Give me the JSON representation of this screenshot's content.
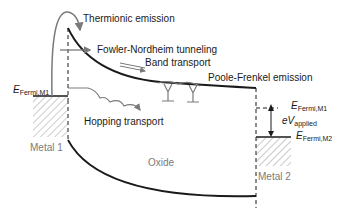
{
  "diagram": {
    "labels": {
      "thermionic": "Thermionic emission",
      "fowler": "Fowler-Nordheim tunneling",
      "band": "Band transport",
      "poole": "Poole-Frenkel emission",
      "hopping": "Hopping transport",
      "oxide": "Oxide",
      "metal1": "Metal 1",
      "metal2": "Metal 2"
    },
    "fermi_m1_left": {
      "main": "E",
      "sub": "Fermi,M1"
    },
    "fermi_m1_right": {
      "main": "E",
      "sub": "Fermi,M1"
    },
    "fermi_m2": {
      "main": "E",
      "sub": "Fermi,M2"
    },
    "applied": {
      "main": "eV",
      "sub": "applied"
    },
    "colors": {
      "band_line": "#1a1a1a",
      "arrow_gray": "#7a7a7a",
      "hatch": "#9a9a9a",
      "text": "#1a1a1a",
      "metal_text": "#7a7a7a"
    }
  }
}
